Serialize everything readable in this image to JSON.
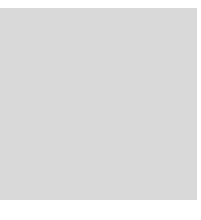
{
  "board": {
    "background_color": "#d9d9d9",
    "line_color": "#3a3a3a",
    "edge_color": "#1a1a1a",
    "grid_x": [
      6,
      24,
      42,
      60,
      78,
      96,
      114,
      132,
      151,
      169,
      187
    ],
    "grid_y": [
      18,
      37,
      55,
      73,
      92,
      110,
      128,
      146,
      164,
      182,
      200
    ],
    "left_edge": true,
    "bottom_edge": true,
    "star_points": [
      {
        "col": 3,
        "row": 1
      },
      {
        "col": 9,
        "row": 1
      },
      {
        "col": 9,
        "row": 7
      }
    ],
    "stones": [
      {
        "color": "white",
        "col": 2,
        "row": 6
      },
      {
        "color": "white",
        "col": 3,
        "row": 6
      },
      {
        "color": "white",
        "col": 4,
        "row": 6
      },
      {
        "color": "white",
        "col": 5,
        "row": 6
      },
      {
        "color": "white",
        "col": 6,
        "row": 6
      },
      {
        "color": "white",
        "col": 1,
        "row": 7
      },
      {
        "color": "black",
        "col": 2,
        "row": 7
      },
      {
        "color": "black",
        "col": 3,
        "row": 7
      },
      {
        "color": "black",
        "col": 4,
        "row": 7
      },
      {
        "color": "black",
        "col": 5,
        "row": 7
      },
      {
        "color": "white",
        "col": 6,
        "row": 7
      },
      {
        "color": "white",
        "col": 1,
        "row": 8
      },
      {
        "color": "black",
        "col": 2,
        "row": 8
      },
      {
        "color": "black",
        "col": 5,
        "row": 8
      },
      {
        "color": "white",
        "col": 6,
        "row": 8
      },
      {
        "color": "white",
        "col": 1,
        "row": 9
      },
      {
        "color": "black",
        "col": 2,
        "row": 9
      },
      {
        "color": "black",
        "col": 5,
        "row": 9
      },
      {
        "color": "white",
        "col": 6,
        "row": 9
      },
      {
        "color": "black",
        "col": 1,
        "row": 10
      }
    ]
  },
  "caption": "제10형 (흑선)"
}
